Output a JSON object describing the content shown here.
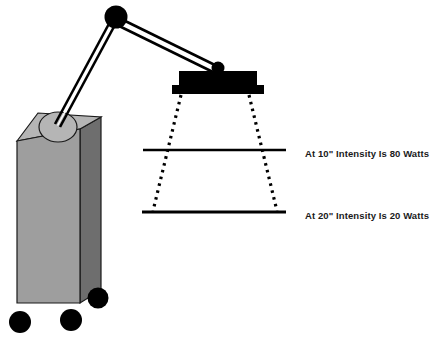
{
  "figure": {
    "background_color": "#ffffff"
  },
  "annotations": [
    {
      "id": "callout-10in",
      "text": "At 10\" Intensity Is 80 Watts",
      "distance_in": 10,
      "intensity_watts": 80,
      "units": "Watts",
      "line_y": 150
    },
    {
      "id": "callout-20in",
      "text": "At 20\" Intensity Is 20 Watts",
      "distance_in": 20,
      "intensity_watts": 20,
      "units": "Watts",
      "line_y": 212
    }
  ],
  "equipment": {
    "cabinet": {
      "label": "mobile cabinet base",
      "front_color": "#9e9e9e",
      "side_color": "#6e6e6e",
      "top_color": "#b5b5b5",
      "outline_color": "#1a1a1a"
    },
    "base_pivot": {
      "label": "base pivot hub",
      "fill_color": "#b5b5b5"
    },
    "arm": {
      "label": "articulated double-rail arm",
      "color": "#000000",
      "segments": 2
    },
    "elbow_joint": {
      "label": "elbow pivot ball",
      "color": "#000000"
    },
    "head_joint": {
      "label": "head pivot knob",
      "color": "#000000"
    },
    "lamp_head": {
      "label": "lamp head housing",
      "color": "#000000"
    },
    "casters": {
      "label": "caster wheels",
      "count": 3,
      "color": "#000000"
    }
  },
  "light_beam": {
    "label": "diverging light beam cone",
    "style": "dotted",
    "color": "#000000",
    "measurement_lines": [
      {
        "label": "10 inch measurement plane",
        "y": 150,
        "x1": 143,
        "x2": 286
      },
      {
        "label": "20 inch measurement plane",
        "y": 212,
        "x1": 142,
        "x2": 286
      }
    ]
  }
}
